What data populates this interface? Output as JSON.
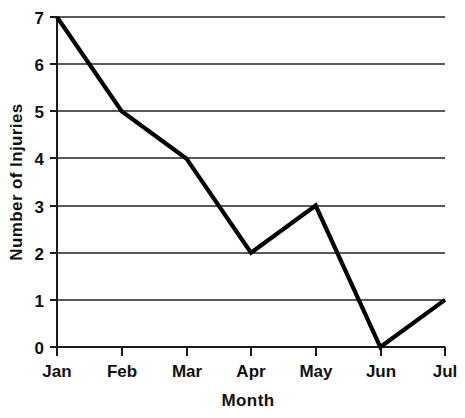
{
  "chart_data": {
    "type": "line",
    "title": "",
    "subtitle": "",
    "xlabel": "Month",
    "ylabel": "Number of Injuries",
    "categories": [
      "Jan",
      "Feb",
      "Mar",
      "Apr",
      "May",
      "Jun",
      "Jul"
    ],
    "values": [
      7,
      5,
      4,
      2,
      3,
      0,
      1
    ],
    "series": [
      {
        "name": "Number of Injuries",
        "values": [
          7,
          5,
          4,
          2,
          3,
          0,
          1
        ]
      }
    ],
    "y_tick_labels": [
      "0",
      "1",
      "2",
      "3",
      "4",
      "5",
      "6",
      "7"
    ],
    "y_ticks": [
      0,
      1,
      2,
      3,
      4,
      5,
      6,
      7
    ],
    "ylim": [
      0,
      7
    ],
    "xlim": [
      0,
      6
    ],
    "grid": true,
    "grid_axis": "y",
    "legend": false,
    "legend_position": "none",
    "markers": false,
    "line_color": "#000000",
    "grid_color": "#5a5a5a",
    "axis_color": "#1a1a1a",
    "background_color": "#ffffff"
  },
  "axes": {
    "y_title": "Number of Injuries",
    "x_title": "Month"
  },
  "y_tick_labels": [
    {
      "text": "7"
    },
    {
      "text": "6"
    },
    {
      "text": "5"
    },
    {
      "text": "4"
    },
    {
      "text": "3"
    },
    {
      "text": "2"
    },
    {
      "text": "1"
    },
    {
      "text": "0"
    }
  ],
  "x_tick_labels": [
    {
      "text": "Jan"
    },
    {
      "text": "Feb"
    },
    {
      "text": "Mar"
    },
    {
      "text": "Apr"
    },
    {
      "text": "May"
    },
    {
      "text": "Jun"
    },
    {
      "text": "Jul"
    }
  ]
}
